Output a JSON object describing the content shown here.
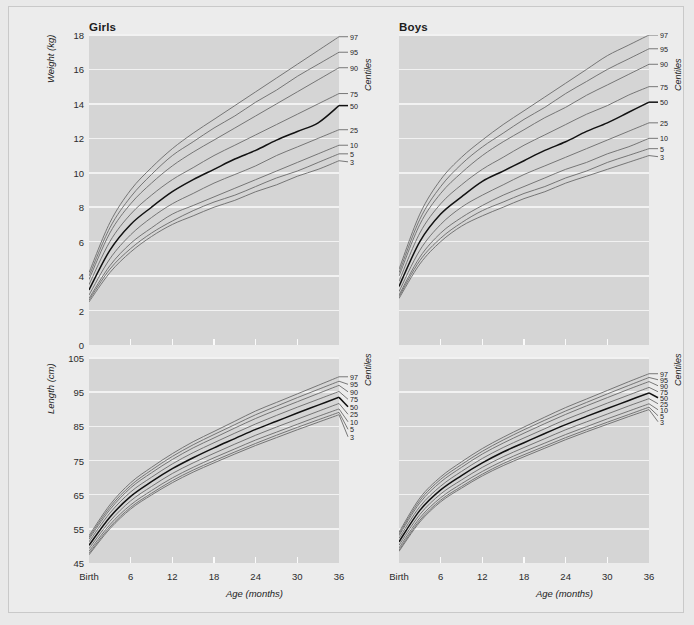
{
  "page": {
    "background_color": "#ececec",
    "plot_background_color": "#d5d5d5",
    "gridline_color": "#f2f2f2",
    "curve_color": "#6a6a6a",
    "median_curve_color": "#111111"
  },
  "columns": [
    {
      "key": "girls",
      "title": "Girls"
    },
    {
      "key": "boys",
      "title": "Boys"
    }
  ],
  "labels": {
    "centiles_title": "Centiles",
    "x_axis_title": "Age (months)",
    "weight_axis_title": "Weight (kg)",
    "length_axis_title": "Length (cm)"
  },
  "chart_data": [
    {
      "id": "girls-weight",
      "type": "line",
      "title": "Girls",
      "xlabel": "Age (months)",
      "ylabel": "Weight (kg)",
      "legend_title": "Centiles",
      "legend_position": "right",
      "grid": true,
      "xlim": [
        0,
        36
      ],
      "ylim": [
        0,
        18
      ],
      "x": [
        0,
        3,
        6,
        9,
        12,
        15,
        18,
        21,
        24,
        27,
        30,
        33,
        36
      ],
      "xticklabels": [
        "Birth",
        "6",
        "12",
        "18",
        "24",
        "30",
        "36"
      ],
      "xtickvalues": [
        0,
        6,
        12,
        18,
        24,
        30,
        36
      ],
      "ytickvalues": [
        0,
        2,
        4,
        6,
        8,
        10,
        12,
        14,
        16,
        18
      ],
      "yticklabels": [
        "0",
        "2",
        "4",
        "6",
        "8",
        "10",
        "12",
        "14",
        "16",
        "18"
      ],
      "series": [
        {
          "name": "97",
          "values": [
            4.2,
            7.1,
            9.0,
            10.3,
            11.4,
            12.3,
            13.1,
            13.9,
            14.7,
            15.5,
            16.3,
            17.1,
            17.9
          ]
        },
        {
          "name": "95",
          "values": [
            4.0,
            6.8,
            8.6,
            9.9,
            11.0,
            11.8,
            12.6,
            13.3,
            14.1,
            14.8,
            15.6,
            16.3,
            17.0
          ]
        },
        {
          "name": "90",
          "values": [
            3.8,
            6.5,
            8.2,
            9.4,
            10.4,
            11.2,
            11.9,
            12.6,
            13.3,
            14.0,
            14.7,
            15.4,
            16.1
          ]
        },
        {
          "name": "75",
          "values": [
            3.5,
            6.0,
            7.6,
            8.7,
            9.6,
            10.3,
            11.0,
            11.6,
            12.2,
            12.8,
            13.4,
            14.0,
            14.6
          ]
        },
        {
          "name": "50",
          "values": [
            3.2,
            5.5,
            7.0,
            8.0,
            8.9,
            9.6,
            10.2,
            10.8,
            11.3,
            11.9,
            12.4,
            12.9,
            13.9
          ]
        },
        {
          "name": "25",
          "values": [
            2.9,
            5.0,
            6.4,
            7.4,
            8.2,
            8.8,
            9.4,
            9.9,
            10.4,
            11.0,
            11.5,
            12.0,
            12.5
          ]
        },
        {
          "name": "10",
          "values": [
            2.7,
            4.6,
            5.9,
            6.8,
            7.6,
            8.1,
            8.6,
            9.1,
            9.6,
            10.1,
            10.6,
            11.1,
            11.6
          ]
        },
        {
          "name": "5",
          "values": [
            2.6,
            4.4,
            5.6,
            6.5,
            7.2,
            7.8,
            8.3,
            8.7,
            9.2,
            9.7,
            10.1,
            10.6,
            11.1
          ]
        },
        {
          "name": "3",
          "values": [
            2.5,
            4.2,
            5.4,
            6.3,
            7.0,
            7.5,
            8.0,
            8.4,
            8.9,
            9.3,
            9.8,
            10.2,
            10.7
          ]
        }
      ]
    },
    {
      "id": "boys-weight",
      "type": "line",
      "title": "Boys",
      "xlabel": "Age (months)",
      "ylabel": "Weight (kg)",
      "legend_title": "Centiles",
      "legend_position": "right",
      "grid": true,
      "xlim": [
        0,
        36
      ],
      "ylim": [
        0,
        18
      ],
      "x": [
        0,
        3,
        6,
        9,
        12,
        15,
        18,
        21,
        24,
        27,
        30,
        33,
        36
      ],
      "xticklabels": [
        "Birth",
        "6",
        "12",
        "18",
        "24",
        "30",
        "36"
      ],
      "xtickvalues": [
        0,
        6,
        12,
        18,
        24,
        30,
        36
      ],
      "ytickvalues": [
        0,
        2,
        4,
        6,
        8,
        10,
        12,
        14,
        16,
        18
      ],
      "yticklabels": [
        "0",
        "2",
        "4",
        "6",
        "8",
        "10",
        "12",
        "14",
        "16",
        "18"
      ],
      "series": [
        {
          "name": "97",
          "values": [
            4.4,
            7.6,
            9.6,
            10.9,
            11.9,
            12.8,
            13.6,
            14.4,
            15.2,
            16.0,
            16.8,
            17.4,
            18.0
          ]
        },
        {
          "name": "95",
          "values": [
            4.2,
            7.3,
            9.2,
            10.5,
            11.5,
            12.3,
            13.1,
            13.8,
            14.6,
            15.3,
            16.0,
            16.6,
            17.2
          ]
        },
        {
          "name": "90",
          "values": [
            4.0,
            7.0,
            8.8,
            10.0,
            11.0,
            11.8,
            12.5,
            13.2,
            13.8,
            14.5,
            15.1,
            15.7,
            16.3
          ]
        },
        {
          "name": "75",
          "values": [
            3.7,
            6.5,
            8.2,
            9.3,
            10.2,
            10.9,
            11.6,
            12.2,
            12.8,
            13.4,
            13.9,
            14.5,
            15.0
          ]
        },
        {
          "name": "50",
          "values": [
            3.4,
            6.0,
            7.6,
            8.6,
            9.5,
            10.1,
            10.7,
            11.3,
            11.8,
            12.4,
            12.9,
            13.5,
            14.1
          ]
        },
        {
          "name": "25",
          "values": [
            3.1,
            5.5,
            7.0,
            8.0,
            8.7,
            9.3,
            9.9,
            10.4,
            10.9,
            11.4,
            11.9,
            12.4,
            12.9
          ]
        },
        {
          "name": "10",
          "values": [
            2.9,
            5.1,
            6.5,
            7.4,
            8.1,
            8.7,
            9.2,
            9.7,
            10.2,
            10.6,
            11.1,
            11.5,
            12.0
          ]
        },
        {
          "name": "5",
          "values": [
            2.8,
            4.9,
            6.2,
            7.1,
            7.8,
            8.3,
            8.8,
            9.2,
            9.7,
            10.1,
            10.6,
            11.0,
            11.4
          ]
        },
        {
          "name": "3",
          "values": [
            2.7,
            4.7,
            6.0,
            6.9,
            7.5,
            8.0,
            8.5,
            8.9,
            9.4,
            9.8,
            10.2,
            10.6,
            11.0
          ]
        }
      ]
    },
    {
      "id": "girls-length",
      "type": "line",
      "title": "Girls",
      "xlabel": "Age (months)",
      "ylabel": "Length (cm)",
      "legend_title": "Centiles",
      "legend_position": "right",
      "grid": true,
      "xlim": [
        0,
        36
      ],
      "ylim": [
        45,
        105
      ],
      "x": [
        0,
        3,
        6,
        9,
        12,
        15,
        18,
        21,
        24,
        27,
        30,
        33,
        36
      ],
      "xticklabels": [
        "Birth",
        "6",
        "12",
        "18",
        "24",
        "30",
        "36"
      ],
      "xtickvalues": [
        0,
        6,
        12,
        18,
        24,
        30,
        36
      ],
      "ytickvalues": [
        45,
        55,
        65,
        75,
        85,
        95,
        105
      ],
      "yticklabels": [
        "45",
        "55",
        "65",
        "75",
        "85",
        "95",
        "105"
      ],
      "series": [
        {
          "name": "97",
          "values": [
            53.0,
            62.0,
            68.5,
            73.0,
            77.0,
            80.5,
            83.5,
            86.5,
            89.5,
            92.0,
            94.5,
            97.0,
            99.5
          ]
        },
        {
          "name": "95",
          "values": [
            52.5,
            61.3,
            67.7,
            72.2,
            76.2,
            79.6,
            82.6,
            85.5,
            88.4,
            90.9,
            93.4,
            95.8,
            98.2
          ]
        },
        {
          "name": "90",
          "values": [
            52.0,
            60.6,
            67.0,
            71.4,
            75.3,
            78.7,
            81.6,
            84.5,
            87.3,
            89.8,
            92.2,
            94.6,
            97.0
          ]
        },
        {
          "name": "75",
          "values": [
            51.2,
            59.6,
            65.8,
            70.1,
            74.0,
            77.3,
            80.2,
            83.0,
            85.7,
            88.2,
            90.6,
            92.9,
            95.2
          ]
        },
        {
          "name": "50",
          "values": [
            50.2,
            58.4,
            64.5,
            68.8,
            72.6,
            75.8,
            78.7,
            81.4,
            84.1,
            86.5,
            88.9,
            91.2,
            93.5
          ]
        },
        {
          "name": "25",
          "values": [
            49.2,
            57.2,
            63.2,
            67.4,
            71.2,
            74.3,
            77.1,
            79.8,
            82.4,
            84.8,
            87.1,
            89.4,
            91.7
          ]
        },
        {
          "name": "10",
          "values": [
            48.4,
            56.2,
            62.0,
            66.2,
            69.9,
            73.0,
            75.8,
            78.4,
            81.0,
            83.3,
            85.6,
            87.9,
            90.1
          ]
        },
        {
          "name": "5",
          "values": [
            47.8,
            55.5,
            61.3,
            65.4,
            69.1,
            72.2,
            74.9,
            77.5,
            80.0,
            82.4,
            84.7,
            86.9,
            89.1
          ]
        },
        {
          "name": "3",
          "values": [
            47.4,
            55.0,
            60.8,
            64.9,
            68.5,
            71.6,
            74.3,
            76.9,
            79.4,
            81.7,
            84.0,
            86.2,
            88.4
          ]
        }
      ]
    },
    {
      "id": "boys-length",
      "type": "line",
      "title": "Boys",
      "xlabel": "Age (months)",
      "ylabel": "Length (cm)",
      "legend_title": "Centiles",
      "legend_position": "right",
      "grid": true,
      "xlim": [
        45,
        105
      ],
      "ylim": [
        45,
        105
      ],
      "x": [
        0,
        3,
        6,
        9,
        12,
        15,
        18,
        21,
        24,
        27,
        30,
        33,
        36
      ],
      "xticklabels": [
        "Birth",
        "6",
        "12",
        "18",
        "24",
        "30",
        "36"
      ],
      "xtickvalues": [
        0,
        6,
        12,
        18,
        24,
        30,
        36
      ],
      "ytickvalues": [
        45,
        55,
        65,
        75,
        85,
        95,
        105
      ],
      "yticklabels": [
        "45",
        "55",
        "65",
        "75",
        "85",
        "95",
        "105"
      ],
      "series": [
        {
          "name": "97",
          "values": [
            54.0,
            64.0,
            70.2,
            74.6,
            78.5,
            81.8,
            84.8,
            87.7,
            90.5,
            93.0,
            95.5,
            98.0,
            100.4
          ]
        },
        {
          "name": "95",
          "values": [
            53.5,
            63.3,
            69.5,
            73.8,
            77.7,
            81.0,
            84.0,
            86.8,
            89.5,
            92.0,
            94.5,
            96.9,
            99.3
          ]
        },
        {
          "name": "90",
          "values": [
            53.0,
            62.6,
            68.7,
            73.0,
            76.9,
            80.1,
            83.0,
            85.8,
            88.5,
            91.0,
            93.4,
            95.8,
            98.1
          ]
        },
        {
          "name": "75",
          "values": [
            52.2,
            61.5,
            67.5,
            71.8,
            75.6,
            78.8,
            81.6,
            84.3,
            87.0,
            89.4,
            91.8,
            94.1,
            96.4
          ]
        },
        {
          "name": "50",
          "values": [
            51.2,
            60.4,
            66.4,
            70.6,
            74.3,
            77.5,
            80.2,
            82.9,
            85.5,
            87.9,
            90.2,
            92.5,
            94.8
          ]
        },
        {
          "name": "25",
          "values": [
            50.2,
            59.2,
            65.2,
            69.3,
            73.0,
            76.1,
            78.8,
            81.4,
            84.0,
            86.3,
            88.6,
            90.9,
            93.1
          ]
        },
        {
          "name": "10",
          "values": [
            49.4,
            58.2,
            64.1,
            68.2,
            71.8,
            74.9,
            77.6,
            80.1,
            82.6,
            84.9,
            87.2,
            89.4,
            91.6
          ]
        },
        {
          "name": "5",
          "values": [
            48.8,
            57.5,
            63.4,
            67.4,
            71.0,
            74.1,
            76.7,
            79.2,
            81.7,
            84.0,
            86.2,
            88.4,
            90.6
          ]
        },
        {
          "name": "3",
          "values": [
            48.4,
            57.0,
            62.9,
            66.9,
            70.5,
            73.5,
            76.1,
            78.6,
            81.1,
            83.4,
            85.6,
            87.8,
            89.9
          ]
        }
      ]
    }
  ]
}
